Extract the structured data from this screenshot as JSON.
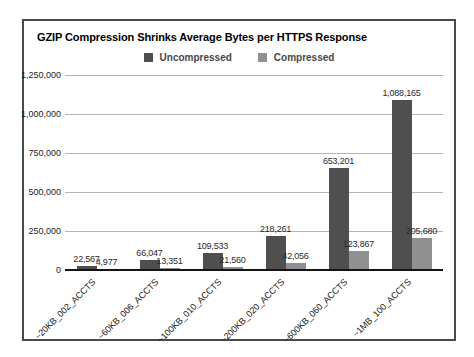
{
  "chart_data": {
    "type": "bar",
    "title": "GZIP Compression Shrinks Average Bytes per HTTPS Response",
    "categories": [
      "~20KB_002_ACCTS",
      "~60KB_006_ACCTS",
      "~100KB_010_ACCTS",
      "~200KB_020_ACCTS",
      "~600KB_060_ACCTS",
      "~1MB_100_ACCTS"
    ],
    "series": [
      {
        "name": "Uncompressed",
        "color": "#4f4f4f",
        "values": [
          22567,
          66047,
          109533,
          218261,
          653201,
          1088165
        ]
      },
      {
        "name": "Compressed",
        "color": "#909090",
        "values": [
          4977,
          13351,
          21560,
          42056,
          123867,
          205680
        ]
      }
    ],
    "xlabel": "",
    "ylabel": "",
    "ylim": [
      0,
      1250000
    ],
    "ytick_interval": 250000,
    "grid": true,
    "legend_position": "top-center",
    "value_labels_shown": true
  },
  "colors": {
    "frame_border": "#4a4a4a",
    "gridline": "#b5b5b5",
    "axis_line": "#141414",
    "background": "#ffffff"
  }
}
